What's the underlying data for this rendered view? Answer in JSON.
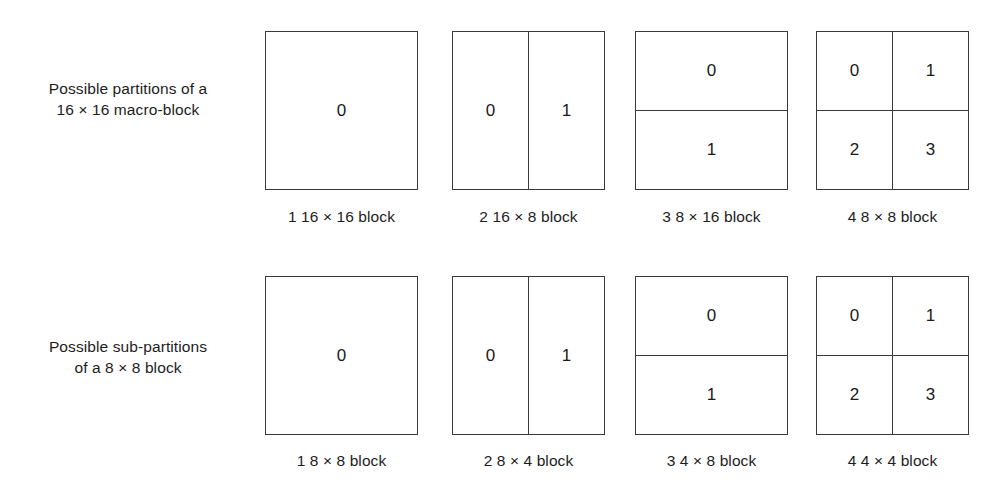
{
  "figure": {
    "rows": [
      {
        "label_line1": "Possible partitions of a",
        "label_line2": "16 × 16 macro-block",
        "blocks": [
          {
            "type": "single",
            "cells": [
              "0"
            ],
            "caption": "1 16 × 16 block"
          },
          {
            "type": "vsplit",
            "cells": [
              "0",
              "1"
            ],
            "caption": "2 16 × 8 block"
          },
          {
            "type": "hsplit",
            "cells": [
              "0",
              "1"
            ],
            "caption": "3 8 × 16 block"
          },
          {
            "type": "quad",
            "cells": [
              "0",
              "1",
              "2",
              "3"
            ],
            "caption": "4 8 × 8 block"
          }
        ]
      },
      {
        "label_line1": "Possible sub-partitions",
        "label_line2": "of a 8 × 8 block",
        "blocks": [
          {
            "type": "single",
            "cells": [
              "0"
            ],
            "caption": "1 8 × 8 block"
          },
          {
            "type": "vsplit",
            "cells": [
              "0",
              "1"
            ],
            "caption": "2 8 × 4 block"
          },
          {
            "type": "hsplit",
            "cells": [
              "0",
              "1"
            ],
            "caption": "3 4 × 8 block"
          },
          {
            "type": "quad",
            "cells": [
              "0",
              "1",
              "2",
              "3"
            ],
            "caption": "4 4 × 4 block"
          }
        ]
      }
    ],
    "colors": {
      "background": "#ffffff",
      "stroke": "#3a3a3a",
      "text": "#1a1a1a"
    }
  }
}
